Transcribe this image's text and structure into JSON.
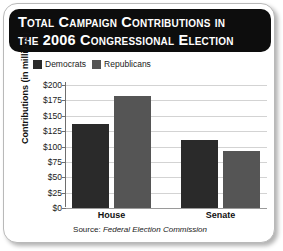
{
  "title": {
    "line1": "Total Campaign Contributions in",
    "line2": "the 2006 Congressional Election"
  },
  "source": {
    "prefix": "Source: ",
    "name": "Federal Election Commission"
  },
  "colors": {
    "democrats": "#2a2a2a",
    "republicans": "#555555",
    "title_bar": "#0d0d0d",
    "gridline": "#d3d3d3",
    "axis": "#6e6e6e"
  },
  "chart_data": {
    "type": "bar",
    "title": "Total Campaign Contributions in the 2006 Congressional Election",
    "xlabel": "",
    "ylabel": "Contributions (in millions)",
    "categories": [
      "House",
      "Senate"
    ],
    "series": [
      {
        "name": "Democrats",
        "values": [
          137,
          110
        ],
        "color": "#2a2a2a"
      },
      {
        "name": "Republicans",
        "values": [
          182,
          93
        ],
        "color": "#555555"
      }
    ],
    "ylim": [
      0,
      200
    ],
    "yticks": [
      0,
      25,
      50,
      75,
      100,
      125,
      150,
      175,
      200
    ],
    "ytick_labels": [
      "$0",
      "$25",
      "$50",
      "$75",
      "$100",
      "$125",
      "$150",
      "$175",
      "$200"
    ],
    "grid": true,
    "legend_position": "top-left",
    "annotation": "Source: Federal Election Commission"
  }
}
